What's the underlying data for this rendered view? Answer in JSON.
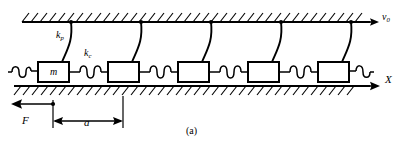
{
  "figure": {
    "caption": "(a)",
    "type": "mechanical-schematic"
  },
  "labels": {
    "spring_pinning": {
      "symbol": "k",
      "subscript": "p"
    },
    "spring_coupling": {
      "symbol": "k",
      "subscript": "c"
    },
    "mass": {
      "symbol": "m",
      "subscript": ""
    },
    "drive_velocity": {
      "symbol": "v",
      "subscript": "0"
    },
    "axis_x": {
      "symbol": "X",
      "subscript": ""
    },
    "force": {
      "symbol": "F",
      "subscript": ""
    },
    "lattice_spacing": {
      "symbol": "a",
      "subscript": ""
    }
  },
  "colors": {
    "ink": "#000000",
    "background": "#ffffff"
  },
  "geometry": {
    "top_rail_y": 22,
    "bottom_rail_y": 86,
    "mass_count": 5,
    "mass_width": 31,
    "mass_height": 20,
    "mass_left_positions": [
      38,
      108,
      178,
      248,
      318
    ],
    "spacing_a_from": 53,
    "spacing_a_to": 123,
    "force_arrow_from": 53,
    "force_arrow_to": 10
  }
}
